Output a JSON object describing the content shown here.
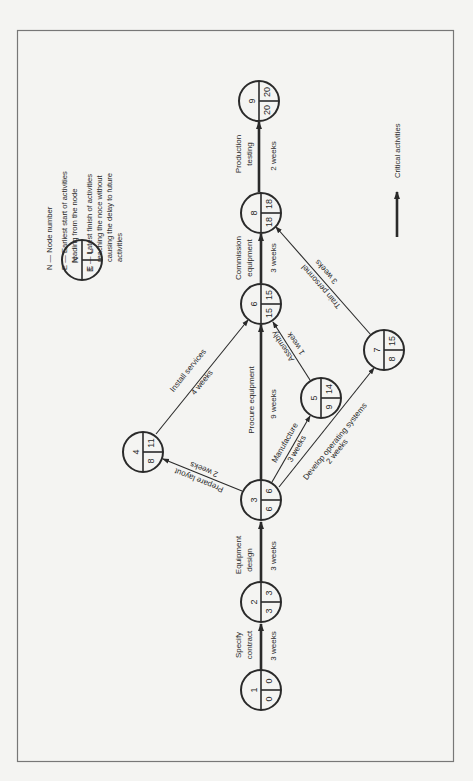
{
  "diagram": {
    "type": "activity-on-arrow network (critical path)",
    "orientation": "rotated 90 degrees counter-clockwise",
    "colors": {
      "ink": "#2a2a2a",
      "frame": "#777777",
      "paper": "#f4f4f2"
    },
    "legend": {
      "symbol": {
        "n": "N",
        "e": "E",
        "l": "L"
      },
      "lines": [
        "N — Node number",
        "E — Earliest start of activities",
        "leading from the node",
        "L — Latest finish of activities",
        "reaching the noce without",
        "causing the delay to future",
        "activities"
      ],
      "critical_label": "Critical activities"
    },
    "nodes": [
      {
        "n": "1",
        "e": "0",
        "l": "0"
      },
      {
        "n": "2",
        "e": "3",
        "l": "3"
      },
      {
        "n": "3",
        "e": "6",
        "l": "6"
      },
      {
        "n": "4",
        "e": "8",
        "l": "11"
      },
      {
        "n": "5",
        "e": "9",
        "l": "14"
      },
      {
        "n": "6",
        "e": "15",
        "l": "15"
      },
      {
        "n": "7",
        "e": "8",
        "l": "15"
      },
      {
        "n": "8",
        "e": "18",
        "l": "18"
      },
      {
        "n": "9",
        "e": "20",
        "l": "20"
      }
    ],
    "activities": [
      {
        "from": "1",
        "to": "2",
        "name_l1": "Specify",
        "name_l2": "contract",
        "duration": "3 weeks",
        "critical": true
      },
      {
        "from": "2",
        "to": "3",
        "name_l1": "Equipment",
        "name_l2": "design",
        "duration": "3 weeks",
        "critical": true
      },
      {
        "from": "3",
        "to": "6",
        "name": "Procure equipment",
        "duration": "9 weeks",
        "critical": true
      },
      {
        "from": "3",
        "to": "4",
        "name": "Prepare layout",
        "duration": "2 weeks",
        "critical": false
      },
      {
        "from": "4",
        "to": "6",
        "name": "Install services",
        "duration": "4 weeks",
        "critical": false
      },
      {
        "from": "3",
        "to": "5",
        "name": "Manufacture",
        "duration": "3 weeks",
        "critical": false
      },
      {
        "from": "5",
        "to": "6",
        "name": "Assembly",
        "duration": "1 week",
        "critical": false
      },
      {
        "from": "3",
        "to": "7",
        "name": "Develop operating systems",
        "duration": "2 weeks",
        "critical": false
      },
      {
        "from": "7",
        "to": "8",
        "name": "Train personnel",
        "duration": "3 weeks",
        "critical": false
      },
      {
        "from": "6",
        "to": "8",
        "name_l1": "Commission",
        "name_l2": "equipment",
        "duration": "3 weeks",
        "critical": true
      },
      {
        "from": "8",
        "to": "9",
        "name_l1": "Production",
        "name_l2": "testing",
        "duration": "2 weeks",
        "critical": true
      }
    ]
  }
}
